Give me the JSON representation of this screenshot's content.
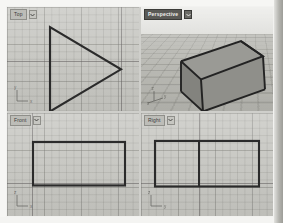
{
  "app": {
    "name": "CAD Viewport Workspace",
    "layout": "four-viewport-2x2",
    "background_color": "#f2f2f0",
    "viewport_background_color": "#c6c6c1",
    "grid_line_color": "#6e6e69",
    "geometry_line_color": "#2b2b2b",
    "shaded_face_color": "#8b8b86",
    "active_tab_color": "#5a5a56"
  },
  "viewports": [
    {
      "id": "top-left",
      "label": "Top",
      "active": false,
      "projection": "parallel",
      "menu_icon": "chevron-down-icon",
      "gizmo": {
        "icon": "axis-gizmo-icon",
        "axes": [
          "y",
          "x"
        ]
      },
      "geometry": {
        "name": "triangle-profile",
        "type": "polygon",
        "description": "Right-pointing triangle profile of the wedge solid",
        "points": "43,20 43,104 114,62"
      }
    },
    {
      "id": "top-right",
      "label": "Perspective",
      "active": true,
      "projection": "perspective",
      "menu_icon": "chevron-down-icon",
      "gizmo": {
        "icon": "axis-gizmo-icon",
        "axes": [
          "z",
          "y",
          "x"
        ]
      },
      "geometry": {
        "name": "wedge-solid",
        "type": "shaded-solid",
        "description": "Triangular prism (wedge) shown shaded on a ground plane",
        "top_face": "40,54 100,34 122,49 60,72",
        "front_face": "40,54 60,72 62,104 40,84",
        "side_face": "60,72 122,49 124,82 62,104"
      }
    },
    {
      "id": "bottom-left",
      "label": "Front",
      "active": false,
      "projection": "parallel",
      "menu_icon": "chevron-down-icon",
      "gizmo": {
        "icon": "axis-gizmo-icon",
        "axes": [
          "z",
          "x"
        ]
      },
      "geometry": {
        "name": "rectangle-profile",
        "type": "rectangle",
        "description": "Plain rectangle — front elevation of the wedge",
        "x": 26,
        "y": 28,
        "width": 92,
        "height": 42
      }
    },
    {
      "id": "bottom-right",
      "label": "Right",
      "active": false,
      "projection": "parallel",
      "menu_icon": "chevron-down-icon",
      "gizmo": {
        "icon": "axis-gizmo-icon",
        "axes": [
          "z",
          "y"
        ]
      },
      "geometry": {
        "name": "rectangle-with-divider",
        "type": "rectangle-divided",
        "description": "Rectangle with a vertical interior edge — right elevation of the wedge",
        "x": 14,
        "y": 27,
        "width": 104,
        "height": 44,
        "divider_x": 58
      }
    }
  ]
}
